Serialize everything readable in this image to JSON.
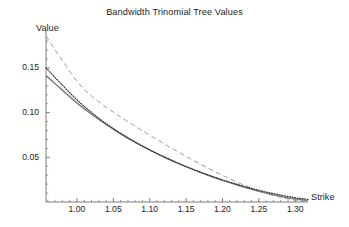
{
  "chart_data": {
    "type": "line",
    "title": "Bandwidth Trinomial Tree Values",
    "xlabel": "Strike",
    "ylabel": "Value",
    "xlim": [
      0.9575,
      1.3175
    ],
    "ylim": [
      0.0,
      0.1925
    ],
    "grid": false,
    "legend": "none",
    "xticks": [
      "1.00",
      "1.05",
      "1.10",
      "1.15",
      "1.20",
      "1.25",
      "1.30"
    ],
    "xtick_values": [
      1.0,
      1.05,
      1.1,
      1.15,
      1.2,
      1.25,
      1.3
    ],
    "yticks": [
      "0.05",
      "0.10",
      "0.15"
    ],
    "ytick_values": [
      0.05,
      0.1,
      0.15
    ],
    "x": [
      0.9575,
      0.98,
      1.0,
      1.02,
      1.04,
      1.06,
      1.08,
      1.1,
      1.12,
      1.14,
      1.16,
      1.18,
      1.2,
      1.22,
      1.24,
      1.26,
      1.28,
      1.3,
      1.3175
    ],
    "series": [
      {
        "name": "dashed-upper-curve",
        "style": "dashed",
        "color": "#8a8a8a",
        "values": [
          0.1855,
          0.1585,
          0.135,
          0.1185,
          0.1062,
          0.0952,
          0.0848,
          0.0748,
          0.065,
          0.0556,
          0.0466,
          0.038,
          0.0298,
          0.0222,
          0.0154,
          0.0096,
          0.0052,
          0.002,
          0.0008
        ]
      },
      {
        "name": "solid-lower-curve",
        "style": "solid",
        "color": "#808080",
        "values": [
          0.1415,
          0.1252,
          0.111,
          0.0982,
          0.0868,
          0.0764,
          0.067,
          0.0584,
          0.0504,
          0.043,
          0.0362,
          0.03,
          0.0242,
          0.019,
          0.0142,
          0.01,
          0.0064,
          0.0034,
          0.0018
        ]
      },
      {
        "name": "dotted-lower-curve",
        "style": "dotted",
        "color": "#2b2b2b",
        "values": [
          0.15,
          0.1308,
          0.1144,
          0.1002,
          0.0878,
          0.0768,
          0.067,
          0.0582,
          0.0502,
          0.043,
          0.0364,
          0.0304,
          0.0248,
          0.0198,
          0.0152,
          0.0112,
          0.0078,
          0.0048,
          0.003
        ]
      }
    ]
  },
  "axes": {
    "y_label": "Value",
    "x_label": "Strike"
  },
  "colors": {
    "background": "#ffffff",
    "axis": "#6e6e6e",
    "text": "#1c1c1c",
    "dashed_series": "#8a8a8a",
    "solid_series": "#808080",
    "dotted_series": "#2b2b2b"
  }
}
